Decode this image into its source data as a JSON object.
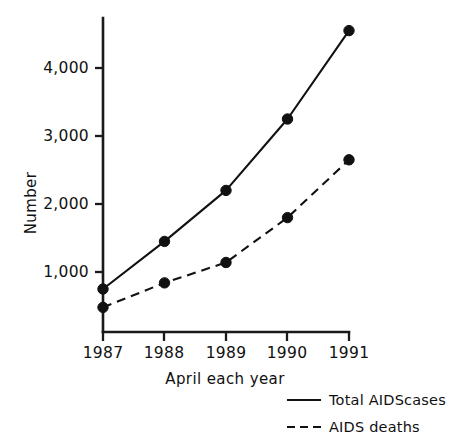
{
  "chart_data": {
    "type": "line",
    "title": "",
    "subtitle": "",
    "xlabel": "April each year",
    "ylabel": "Number",
    "categories": [
      "1987",
      "1988",
      "1989",
      "1990",
      "1991"
    ],
    "x": [
      1987,
      1988,
      1989,
      1990,
      1991
    ],
    "series": [
      {
        "name": "Total AIDScases",
        "style": "solid",
        "marker": "filled-circle",
        "values": [
          750,
          1450,
          2200,
          3250,
          4550
        ]
      },
      {
        "name": "AIDS deaths",
        "style": "dashed",
        "marker": "filled-circle",
        "values": [
          480,
          840,
          1140,
          1800,
          2650
        ]
      }
    ],
    "ylim": [
      0,
      4800
    ],
    "xlim": [
      1986.85,
      1991.05
    ],
    "y_ticks": [
      1000,
      2000,
      3000,
      4000
    ],
    "y_tick_labels": [
      "1,000",
      "2,000",
      "3,000",
      "4,000"
    ],
    "x_ticks": [
      1987,
      1988,
      1989,
      1990,
      1991
    ],
    "x_tick_labels": [
      "1987",
      "1988",
      "1989",
      "1990",
      "1991"
    ],
    "grid": false,
    "legend_position": "bottom-right",
    "legend_entries": [
      {
        "label": "Total AIDScases",
        "style": "solid"
      },
      {
        "label": "AIDS deaths",
        "style": "dashed"
      }
    ],
    "colors": {
      "line": "#111111",
      "marker": "#111111",
      "axis": "#1a1a1a",
      "background": "#ffffff",
      "text": "#111111"
    }
  },
  "axes": {
    "y_title": "Number",
    "x_title": "April each year",
    "y_tick_labels": [
      "1,000",
      "2,000",
      "3,000",
      "4,000"
    ],
    "x_tick_labels": [
      "1987",
      "1988",
      "1989",
      "1990",
      "1991"
    ]
  },
  "legend": {
    "items": [
      {
        "label": "Total AIDScases"
      },
      {
        "label": "AIDS deaths"
      }
    ]
  }
}
